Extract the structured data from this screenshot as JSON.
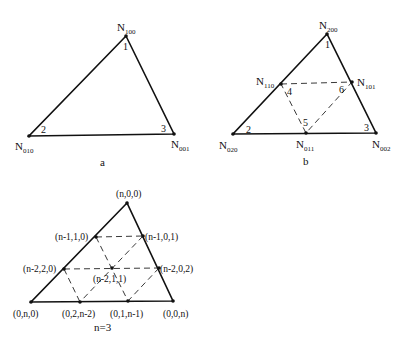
{
  "figure_a": {
    "caption": "a",
    "nodes": [
      {
        "id": "N100",
        "base": "N",
        "sub": "100",
        "corner": "1"
      },
      {
        "id": "N010",
        "base": "N",
        "sub": "010",
        "corner": "2"
      },
      {
        "id": "N001",
        "base": "N",
        "sub": "001",
        "corner": "3"
      }
    ]
  },
  "figure_b": {
    "caption": "b",
    "nodes": [
      {
        "id": "N200",
        "base": "N",
        "sub": "200",
        "corner": "1"
      },
      {
        "id": "N020",
        "base": "N",
        "sub": "020",
        "corner": "2"
      },
      {
        "id": "N002",
        "base": "N",
        "sub": "002",
        "corner": "3"
      },
      {
        "id": "N110",
        "base": "N",
        "sub": "110",
        "corner": "4"
      },
      {
        "id": "N011",
        "base": "N",
        "sub": "011",
        "corner": "5"
      },
      {
        "id": "N101",
        "base": "N",
        "sub": "101",
        "corner": "6"
      }
    ]
  },
  "figure_c": {
    "caption": "n=3",
    "nodes": [
      {
        "id": "n00",
        "label": "(n,0,0)"
      },
      {
        "id": "n-110",
        "label": "(n-1,1,0)"
      },
      {
        "id": "n-101",
        "label": "(n-1,0,1)"
      },
      {
        "id": "n-220",
        "label": "(n-2,2,0)"
      },
      {
        "id": "n-211",
        "label": "(n-2,1,1)"
      },
      {
        "id": "n-202",
        "label": "(n-2,0,2)"
      },
      {
        "id": "0n0",
        "label": "(0,n,0)"
      },
      {
        "id": "02n-2",
        "label": "(0,2,n-2)"
      },
      {
        "id": "01n-1",
        "label": "(0,1,n-1)"
      },
      {
        "id": "00n",
        "label": "(0,0,n)"
      }
    ]
  }
}
